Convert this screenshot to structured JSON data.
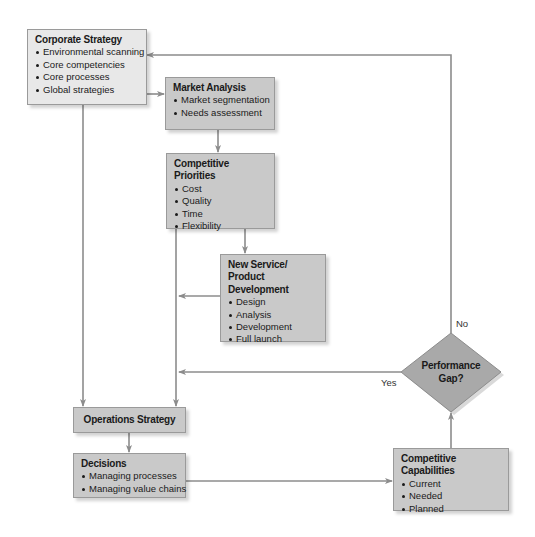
{
  "diagram": {
    "colors": {
      "line": "#8c8c8c",
      "box_light": "#e8e8e8",
      "box_dark": "#c9c9c9",
      "diamond": "#a9a9a9",
      "text": "#1a1a1a"
    },
    "nodes": {
      "corporate_strategy": {
        "title": "Corporate Strategy",
        "items": [
          "Environmental scanning",
          "Core competencies",
          "Core processes",
          "Global strategies"
        ]
      },
      "market_analysis": {
        "title": "Market Analysis",
        "items": [
          "Market segmentation",
          "Needs assessment"
        ]
      },
      "competitive_priorities": {
        "title": "Competitive Priorities",
        "items": [
          "Cost",
          "Quality",
          "Time",
          "Flexibility"
        ]
      },
      "new_service_development": {
        "title_line1": "New Service/",
        "title_line2": "Product Development",
        "items": [
          "Design",
          "Analysis",
          "Development",
          "Full launch"
        ]
      },
      "operations_strategy": {
        "title": "Operations Strategy"
      },
      "decisions": {
        "title": "Decisions",
        "items": [
          "Managing processes",
          "Managing value chains"
        ]
      },
      "competitive_capabilities": {
        "title": "Competitive Capabilities",
        "items": [
          "Current",
          "Needed",
          "Planned"
        ]
      },
      "performance_gap": {
        "line1": "Performance",
        "line2": "Gap?"
      }
    },
    "edge_labels": {
      "no": "No",
      "yes": "Yes"
    },
    "edges": [
      {
        "from": "corporate_strategy",
        "to": "market_analysis"
      },
      {
        "from": "corporate_strategy",
        "to": "operations_strategy"
      },
      {
        "from": "market_analysis",
        "to": "competitive_priorities"
      },
      {
        "from": "competitive_priorities",
        "to": "new_service_development"
      },
      {
        "from": "competitive_priorities",
        "to": "operations_strategy"
      },
      {
        "from": "new_service_development",
        "to": "operations_strategy"
      },
      {
        "from": "operations_strategy",
        "to": "decisions"
      },
      {
        "from": "decisions",
        "to": "competitive_capabilities"
      },
      {
        "from": "competitive_capabilities",
        "to": "performance_gap"
      },
      {
        "from": "performance_gap",
        "to": "corporate_strategy",
        "label": "No"
      },
      {
        "from": "performance_gap",
        "to": "operations_strategy",
        "label": "Yes"
      }
    ]
  }
}
